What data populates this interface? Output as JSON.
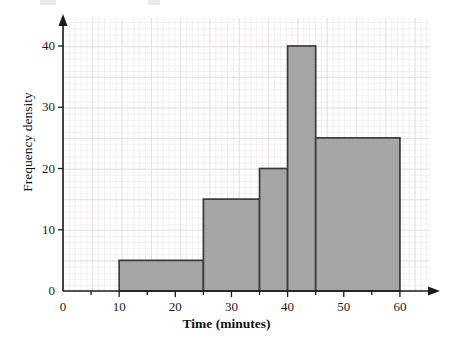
{
  "figure": {
    "background_color": "#ffffff",
    "axis_color": "#1a1a1a",
    "bar_fill_color": "#a9a9a9",
    "bar_edge_color": "#3a3a3a",
    "grid_minor_color": "#f2eff0",
    "grid_major_color": "#e6e0e3"
  },
  "chart_data": {
    "type": "bar",
    "title": "",
    "subtitle": "",
    "xlabel": "Time (minutes)",
    "ylabel": "Frequency density",
    "xlim": [
      0,
      65
    ],
    "ylim": [
      0,
      44
    ],
    "grid": true,
    "legend": null,
    "x_ticks": [
      0,
      10,
      20,
      30,
      40,
      50,
      60
    ],
    "x_tick_labels": [
      "0",
      "10",
      "20",
      "30",
      "40",
      "50",
      "60"
    ],
    "x_minor_ticks": [
      5,
      15,
      25,
      35,
      45,
      55
    ],
    "y_ticks": [
      0,
      10,
      20,
      30,
      40
    ],
    "y_tick_labels": [
      "0",
      "10",
      "20",
      "30",
      "40"
    ],
    "bin_edges": [
      10,
      25,
      35,
      40,
      45,
      60
    ],
    "bins": [
      {
        "start": 10,
        "end": 25,
        "width": 15,
        "frequency_density": 5,
        "frequency": 75
      },
      {
        "start": 25,
        "end": 35,
        "width": 10,
        "frequency_density": 15,
        "frequency": 150
      },
      {
        "start": 35,
        "end": 40,
        "width": 5,
        "frequency_density": 20,
        "frequency": 100
      },
      {
        "start": 40,
        "end": 45,
        "width": 5,
        "frequency_density": 40,
        "frequency": 200
      },
      {
        "start": 45,
        "end": 60,
        "width": 15,
        "frequency_density": 25,
        "frequency": 375
      }
    ],
    "categories": [
      "10-25",
      "25-35",
      "35-40",
      "40-45",
      "45-60"
    ],
    "values": [
      5,
      15,
      20,
      40,
      25
    ]
  },
  "axes": {
    "x_arrow": "right-arrow-icon",
    "y_arrow": "up-arrow-icon"
  }
}
